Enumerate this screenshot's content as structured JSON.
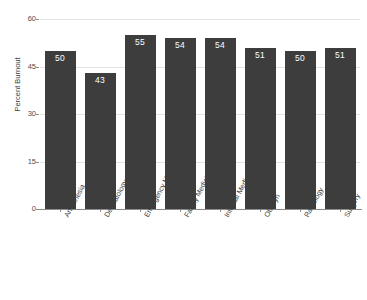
{
  "chart_data": {
    "type": "bar",
    "title": "",
    "xlabel": "",
    "ylabel": "Percent Burnout",
    "ylim": [
      0,
      60
    ],
    "yticks": [
      0,
      15,
      30,
      45,
      60
    ],
    "ytick_labels": [
      "0",
      "15",
      "30",
      "45",
      "60"
    ],
    "grid": true,
    "legend": "none",
    "bar_color": "#3d3d3d",
    "value_label_color": "#ffffff",
    "gridline_color": "#e3e3e3",
    "axis_color": "#8c8c8c",
    "background": "#ffffff",
    "categories": [
      "Anesthesia",
      "Dermatology",
      "Emergency Medicine",
      "Family Medicine",
      "Internal Medicine",
      "Ob/Gyn",
      "Radiology",
      "Surgery"
    ],
    "values": [
      50,
      43,
      55,
      54,
      54,
      51,
      50,
      51
    ],
    "value_labels": [
      "50",
      "43",
      "55",
      "54",
      "54",
      "51",
      "50",
      "51"
    ]
  }
}
